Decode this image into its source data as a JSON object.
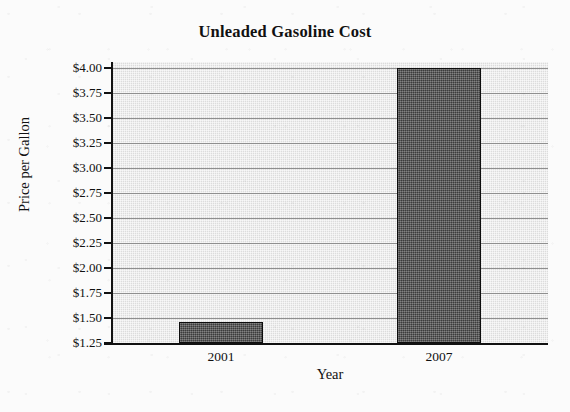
{
  "chart_data": {
    "type": "bar",
    "title": "Unleaded Gasoline Cost",
    "xlabel": "Year",
    "ylabel": "Price per Gallon",
    "categories": [
      "2001",
      "2007"
    ],
    "values": [
      1.46,
      4.0
    ],
    "value_labels": [
      "$1.46",
      "$4.00"
    ],
    "ylim": [
      1.25,
      4.0
    ],
    "ytick_values": [
      4.0,
      3.75,
      3.5,
      3.25,
      3.0,
      2.75,
      2.5,
      2.25,
      2.0,
      1.75,
      1.5,
      1.25
    ],
    "ytick_labels": [
      "$4.00",
      "$3.75",
      "$3.50",
      "$3.25",
      "$3.00",
      "$2.75",
      "$2.50",
      "$2.25",
      "$2.00",
      "$1.75",
      "$1.50",
      "$1.25"
    ],
    "grid": true,
    "legend": false,
    "orientation": "vertical",
    "colors": {
      "bar_fill": "#4d4d4d",
      "bar_border": "#0d0d0d",
      "plot_background": "#dcdcdc",
      "gridline": "#8e8e8e",
      "axis": "#111111",
      "page_background": "#fbfbfb",
      "text": "#111111"
    }
  }
}
